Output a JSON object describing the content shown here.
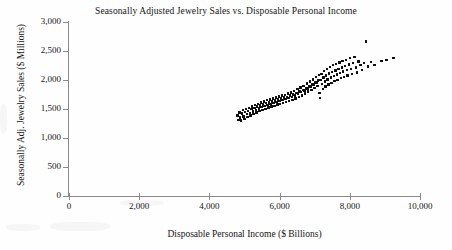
{
  "chart_data": {
    "type": "scatter",
    "title": "Seasonally Adjusted Jewelry Sales vs. Disposable Personal Income",
    "xlabel": "Disposable Personal Income ($ Billions)",
    "ylabel": "Seasonally Adj. Jewelry Sales ($ Millions)",
    "xlim": [
      0,
      10000
    ],
    "ylim": [
      0,
      3000
    ],
    "xticks": [
      0,
      2000,
      4000,
      6000,
      8000,
      10000
    ],
    "xtick_labels": [
      "0",
      "2,000",
      "4,000",
      "6,000",
      "8,000",
      "10,000"
    ],
    "yticks": [
      0,
      500,
      1000,
      1500,
      2000,
      2500,
      3000
    ],
    "ytick_labels": [
      "0",
      "500",
      "1,000",
      "1,500",
      "2,000",
      "2,500",
      "3,000"
    ],
    "grid": false,
    "legend": false,
    "marker": "square",
    "marker_color": "#0d0d0d",
    "marker_size": 2.4,
    "n_points": 160,
    "points": [
      [
        4800,
        1390
      ],
      [
        4830,
        1310
      ],
      [
        4860,
        1440
      ],
      [
        4880,
        1355
      ],
      [
        4905,
        1300
      ],
      [
        4930,
        1425
      ],
      [
        4955,
        1480
      ],
      [
        4975,
        1370
      ],
      [
        5000,
        1330
      ],
      [
        5020,
        1450
      ],
      [
        5045,
        1500
      ],
      [
        5065,
        1410
      ],
      [
        5085,
        1360
      ],
      [
        5105,
        1470
      ],
      [
        5130,
        1520
      ],
      [
        5155,
        1430
      ],
      [
        5175,
        1385
      ],
      [
        5195,
        1495
      ],
      [
        5215,
        1545
      ],
      [
        5240,
        1460
      ],
      [
        5260,
        1410
      ],
      [
        5280,
        1520
      ],
      [
        5300,
        1565
      ],
      [
        5320,
        1485
      ],
      [
        5340,
        1440
      ],
      [
        5360,
        1540
      ],
      [
        5385,
        1590
      ],
      [
        5405,
        1510
      ],
      [
        5425,
        1465
      ],
      [
        5445,
        1560
      ],
      [
        5470,
        1610
      ],
      [
        5490,
        1530
      ],
      [
        5510,
        1485
      ],
      [
        5530,
        1580
      ],
      [
        5555,
        1630
      ],
      [
        5575,
        1550
      ],
      [
        5595,
        1505
      ],
      [
        5615,
        1600
      ],
      [
        5640,
        1650
      ],
      [
        5660,
        1570
      ],
      [
        5680,
        1525
      ],
      [
        5700,
        1615
      ],
      [
        5725,
        1665
      ],
      [
        5745,
        1585
      ],
      [
        5765,
        1540
      ],
      [
        5785,
        1630
      ],
      [
        5810,
        1680
      ],
      [
        5830,
        1600
      ],
      [
        5850,
        1555
      ],
      [
        5870,
        1645
      ],
      [
        5895,
        1700
      ],
      [
        5915,
        1620
      ],
      [
        5935,
        1575
      ],
      [
        5955,
        1665
      ],
      [
        5980,
        1715
      ],
      [
        6000,
        1640
      ],
      [
        6020,
        1590
      ],
      [
        6040,
        1680
      ],
      [
        6065,
        1730
      ],
      [
        6085,
        1655
      ],
      [
        6105,
        1605
      ],
      [
        6125,
        1695
      ],
      [
        6150,
        1745
      ],
      [
        6170,
        1670
      ],
      [
        6190,
        1620
      ],
      [
        6210,
        1710
      ],
      [
        6235,
        1765
      ],
      [
        6255,
        1690
      ],
      [
        6275,
        1640
      ],
      [
        6300,
        1730
      ],
      [
        6325,
        1785
      ],
      [
        6345,
        1705
      ],
      [
        6365,
        1660
      ],
      [
        6390,
        1750
      ],
      [
        6415,
        1810
      ],
      [
        6435,
        1730
      ],
      [
        6455,
        1680
      ],
      [
        6480,
        1775
      ],
      [
        6505,
        1840
      ],
      [
        6525,
        1760
      ],
      [
        6545,
        1705
      ],
      [
        6570,
        1800
      ],
      [
        6595,
        1870
      ],
      [
        6615,
        1790
      ],
      [
        6635,
        1735
      ],
      [
        6660,
        1830
      ],
      [
        6685,
        1900
      ],
      [
        6705,
        1820
      ],
      [
        6725,
        1765
      ],
      [
        6750,
        1865
      ],
      [
        6775,
        1940
      ],
      [
        6795,
        1855
      ],
      [
        6815,
        1800
      ],
      [
        6840,
        1895
      ],
      [
        6865,
        1975
      ],
      [
        6885,
        1890
      ],
      [
        6905,
        1830
      ],
      [
        6930,
        1925
      ],
      [
        6955,
        2010
      ],
      [
        6975,
        1920
      ],
      [
        6995,
        1860
      ],
      [
        7015,
        1955
      ],
      [
        7040,
        2050
      ],
      [
        7060,
        1960
      ],
      [
        7080,
        1895
      ],
      [
        7100,
        1990
      ],
      [
        7120,
        2085
      ],
      [
        7140,
        1780
      ],
      [
        7155,
        1690
      ],
      [
        7170,
        2000
      ],
      [
        7190,
        2100
      ],
      [
        7210,
        1930
      ],
      [
        7230,
        1845
      ],
      [
        7250,
        2040
      ],
      [
        7270,
        2150
      ],
      [
        7290,
        1975
      ],
      [
        7310,
        1890
      ],
      [
        7330,
        2080
      ],
      [
        7350,
        2185
      ],
      [
        7370,
        2010
      ],
      [
        7395,
        1920
      ],
      [
        7415,
        2110
      ],
      [
        7440,
        2220
      ],
      [
        7460,
        2040
      ],
      [
        7480,
        1950
      ],
      [
        7500,
        2140
      ],
      [
        7525,
        2255
      ],
      [
        7545,
        2070
      ],
      [
        7565,
        1980
      ],
      [
        7590,
        2165
      ],
      [
        7615,
        2280
      ],
      [
        7635,
        2095
      ],
      [
        7655,
        2005
      ],
      [
        7680,
        2190
      ],
      [
        7705,
        2300
      ],
      [
        7725,
        2120
      ],
      [
        7745,
        2030
      ],
      [
        7770,
        2215
      ],
      [
        7795,
        2330
      ],
      [
        7815,
        2145
      ],
      [
        7840,
        2055
      ],
      [
        7865,
        2240
      ],
      [
        7890,
        2350
      ],
      [
        7915,
        2170
      ],
      [
        7940,
        2080
      ],
      [
        7970,
        2265
      ],
      [
        8000,
        2375
      ],
      [
        8030,
        2190
      ],
      [
        8060,
        2105
      ],
      [
        8095,
        2290
      ],
      [
        8130,
        2395
      ],
      [
        8170,
        2215
      ],
      [
        8210,
        2130
      ],
      [
        8250,
        2320
      ],
      [
        8300,
        2255
      ],
      [
        8350,
        2175
      ],
      [
        8400,
        2290
      ],
      [
        8460,
        2665
      ],
      [
        8520,
        2230
      ],
      [
        8600,
        2310
      ],
      [
        8700,
        2260
      ],
      [
        8900,
        2330
      ],
      [
        9050,
        2340
      ],
      [
        9250,
        2375
      ]
    ]
  }
}
